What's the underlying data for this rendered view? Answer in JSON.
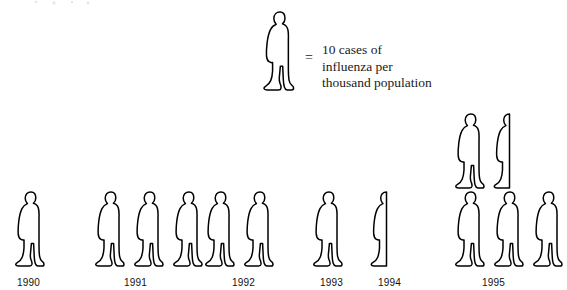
{
  "chart_data": {
    "type": "bar",
    "chart_style": "pictograph",
    "title": "",
    "xlabel": "",
    "ylabel": "",
    "categories": [
      "1990",
      "1991",
      "1992",
      "1993",
      "1994",
      "1995"
    ],
    "values": [
      10,
      30,
      20,
      10,
      5,
      45
    ],
    "unit": "cases of influenza per thousand population",
    "icon_value": 10,
    "icon_symbol": "person-figure",
    "icons_per_category": [
      1,
      3,
      2,
      1,
      0.5,
      4.5
    ],
    "legend": {
      "symbol": "person-figure",
      "equals_sign": "=",
      "lines": [
        "10 cases of",
        "influenza per",
        "thousand population"
      ],
      "full_text": "= 10 cases of influenza per thousand population"
    },
    "grid": false,
    "legend_position": "top-center",
    "colors": {
      "stroke": "#000000",
      "fill": "#ffffff",
      "background": "#ffffff",
      "label": "#111111"
    }
  },
  "groups": [
    {
      "year": "1990",
      "rows": [
        {
          "full": 1,
          "half": 0
        }
      ]
    },
    {
      "year": "1991",
      "rows": [
        {
          "full": 3,
          "half": 0
        }
      ]
    },
    {
      "year": "1992",
      "rows": [
        {
          "full": 2,
          "half": 0
        }
      ]
    },
    {
      "year": "1993",
      "rows": [
        {
          "full": 1,
          "half": 0
        }
      ]
    },
    {
      "year": "1994",
      "rows": [
        {
          "full": 0,
          "half": 1
        }
      ]
    },
    {
      "year": "1995",
      "rows": [
        {
          "full": 1,
          "half": 1
        },
        {
          "full": 3,
          "half": 0
        }
      ]
    }
  ]
}
